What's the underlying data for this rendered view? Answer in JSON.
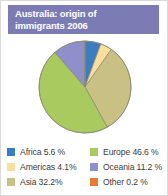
{
  "card": {
    "border_color": "#d9d9d9",
    "background": "#ffffff"
  },
  "title": {
    "text": "Australia: origin of\nimmigrants 2006",
    "line1": "Australia: origin of",
    "line2": "immigrants 2006",
    "banner_color": "#7b7cb4",
    "text_color": "#ffffff"
  },
  "legend": {
    "left_column": [
      {
        "label": "Africa 5.6 %",
        "color": "#3c7cc0"
      },
      {
        "label": "Americas 4.1%",
        "color": "#fadf9a"
      },
      {
        "label": "Asia 32.2%",
        "color": "#c9c184"
      }
    ],
    "right_column": [
      {
        "label": "Europe 46.6 %",
        "color": "#a8c койот"
      },
      {
        "label": "Oceania 11.2 %",
        "color": "#8f8fcb"
      },
      {
        "label": "Other 0.2 %",
        "color": "#e8792f"
      }
    ]
  },
  "chart_data": {
    "type": "pie",
    "title": "Australia: origin of immigrants 2006",
    "unit": "%",
    "start_angle": 0,
    "direction": "clockwise",
    "legend_position": "bottom",
    "categories": [
      "Africa",
      "Americas",
      "Asia",
      "Europe",
      "Oceania",
      "Other"
    ],
    "values": [
      5.6,
      4.1,
      32.2,
      46.6,
      11.2,
      0.2
    ],
    "labels": [
      "Africa 5.6 %",
      "Americas 4.1%",
      "Asia 32.2%",
      "Europe 46.6 %",
      "Oceania 11.2 %",
      "Other 0.2 %"
    ],
    "colors": [
      "#3c7cc0",
      "#fadf9a",
      "#c9c184",
      "#a8ca5e",
      "#8f8fcb",
      "#e8792f"
    ],
    "slices": [
      {
        "name": "Africa",
        "value": 5.6,
        "color": "#3c7cc0"
      },
      {
        "name": "Americas",
        "value": 4.1,
        "color": "#fadf9a"
      },
      {
        "name": "Asia",
        "value": 32.2,
        "color": "#c9c184"
      },
      {
        "name": "Europe",
        "value": 46.6,
        "color": "#a8ca5e"
      },
      {
        "name": "Oceania",
        "value": 11.2,
        "color": "#8f8fcb"
      },
      {
        "name": "Other",
        "value": 0.2,
        "color": "#e8792f"
      }
    ],
    "total": 99.9,
    "center": {
      "x": 84,
      "y": 50
    },
    "radius": 46,
    "stroke_color": "#8a8a72"
  }
}
